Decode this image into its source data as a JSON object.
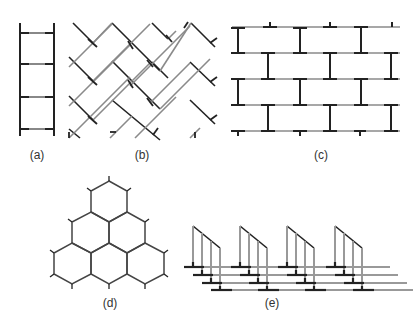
{
  "figure": {
    "panels": [
      {
        "id": "a",
        "label": "(a)",
        "description": "ladder"
      },
      {
        "id": "b",
        "label": "(b)",
        "description": "herringbone"
      },
      {
        "id": "c",
        "label": "(c)",
        "description": "brick wall"
      },
      {
        "id": "d",
        "label": "(d)",
        "description": "honeycomb"
      },
      {
        "id": "e",
        "label": "(e)",
        "description": "stacked ladders"
      }
    ],
    "colors": {
      "bond": "#222222",
      "link": "#8a8a8a",
      "label": "#333333"
    }
  }
}
